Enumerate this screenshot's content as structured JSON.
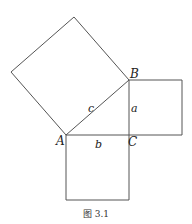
{
  "figure": {
    "caption": "图 3.1",
    "stroke_color": "#555555",
    "points": {
      "A": {
        "label": "A",
        "x": 66,
        "y": 135
      },
      "B": {
        "label": "B",
        "x": 129,
        "y": 80
      },
      "C": {
        "label": "C",
        "x": 129,
        "y": 135
      }
    },
    "sides": {
      "a": {
        "label": "a"
      },
      "b": {
        "label": "b"
      },
      "c": {
        "label": "c"
      }
    },
    "squares": [
      {
        "name": "square-on-hypotenuse",
        "points": "66,135 129,80 74,17 11,72"
      },
      {
        "name": "square-on-side-a",
        "points": "129,80 182,80 182,135 129,135"
      },
      {
        "name": "square-on-side-b",
        "points": "66,135 129,135 129,200 66,200"
      }
    ]
  }
}
